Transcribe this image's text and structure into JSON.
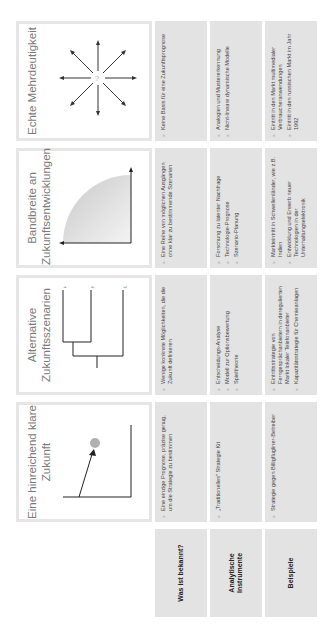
{
  "columns": [
    {
      "title": "Eine hinreichend klare Zukunft",
      "diagram": "single-point-forecast-icon"
    },
    {
      "title": "Alternative Zukunftsszenarien",
      "diagram": "scenario-tree-icon",
      "branch_labels": [
        "1",
        "2",
        "3"
      ]
    },
    {
      "title": "Bandbreite an Zukunftsentwicklungen",
      "diagram": "range-quarter-circle-icon"
    },
    {
      "title": "Echte Mehrdeutigkeit",
      "diagram": "ambiguity-starburst-icon",
      "center_label": "?"
    }
  ],
  "rows": [
    {
      "label": "Was ist bekannt?",
      "cells": [
        [
          "Eine einzige Prognose, präzise genug, um die Strategie zu bestimmen"
        ],
        [
          "Wenige konkrete Möglichkeiten, die die Zukunft definieren"
        ],
        [
          "Eine Reihe von möglichen Ausgängen ohne klar zu bestimmende Szenarien"
        ],
        [
          "Keine Basis für eine Zukunftsprognose"
        ]
      ]
    },
    {
      "label": "Analytische Instrumente",
      "cells": [
        [
          "„Traditionelles\" Strategie Kit"
        ],
        [
          "Entscheidungs-Analyse",
          "Modell zur Optionsbewertung",
          "Spieltheorie"
        ],
        [
          "Forschung zu latenter Nachfrage",
          "Technologie-Prognose",
          "Szenario-Planung"
        ],
        [
          "Analogien und Mustererkennung",
          "Nicht-lineare dynamische Modelle"
        ]
      ]
    },
    {
      "label": "Beispiele",
      "cells": [
        [
          "Strategie gegen Billigflugliner-Betreiber"
        ],
        [
          "Eintrittsstrategie von Ferngesprächanbietern in deregulierten Markt lokaler Telefonanbieter",
          "Kapazitätsstrategie für Chemieanlagen"
        ],
        [
          "Markteintritt in Schwellenländer, wie z.B. Indien",
          "Entwicklung und Erwerb neuer Technologien in der Unterhaltungselektronik"
        ],
        [
          "Eintritt in den Markt multimedialer Verbraucheranwendungen",
          "Eintritt in den russischen Markt im Jahr 1992"
        ]
      ]
    }
  ],
  "colors": {
    "cell_bg": "#e3e3e3",
    "header_border": "#e6e6e6",
    "title_text": "#7a7a7a",
    "dot": "#b0b0b0"
  }
}
